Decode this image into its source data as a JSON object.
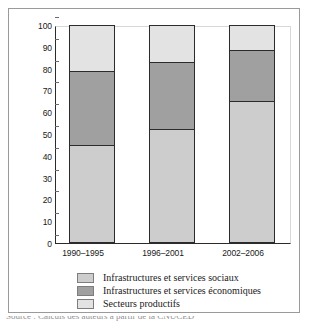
{
  "chart_data": {
    "type": "bar",
    "subtype": "stacked-vertical-100",
    "title": "",
    "xlabel": "",
    "ylabel": "",
    "ylim": [
      0,
      100
    ],
    "yticks": [
      0,
      10,
      20,
      30,
      40,
      50,
      60,
      70,
      80,
      90,
      100
    ],
    "grid": false,
    "legend_position": "bottom-left",
    "categories": [
      "1990–1995",
      "1996–2001",
      "2002–2006"
    ],
    "series": [
      {
        "name": "Infrastructures et services sociaux",
        "color": "#cdcdcd",
        "values": [
          44.5,
          52.0,
          65.0
        ]
      },
      {
        "name": "Infrastructures et services économiques",
        "color": "#a0a0a0",
        "values": [
          34.5,
          31.5,
          24.0
        ]
      },
      {
        "name": "Secteurs productifs",
        "color": "#e3e3e3",
        "values": [
          21.0,
          16.5,
          11.0
        ]
      }
    ],
    "cumulative_tops": [
      [
        44.5,
        79.0,
        100.0
      ],
      [
        52.0,
        83.5,
        100.0
      ],
      [
        65.0,
        89.0,
        100.0
      ]
    ]
  },
  "axis": {
    "tick_labels": [
      "100",
      "90",
      "80",
      "70",
      "60",
      "50",
      "40",
      "30",
      "20",
      "10",
      "0"
    ]
  },
  "legend": {
    "items": [
      {
        "label": "Infrastructures et services sociaux",
        "color": "#cdcdcd"
      },
      {
        "label": "Infrastructures et services économiques",
        "color": "#a0a0a0"
      },
      {
        "label": "Secteurs productifs",
        "color": "#e3e3e3"
      }
    ]
  },
  "caption": {
    "clipped_text": "Source :   Calculs des auteurs à partir de la CNUCED"
  },
  "colors": {
    "frame": "#9a9a9a",
    "axis": "#2b2b2b",
    "background": "#ffffff"
  }
}
